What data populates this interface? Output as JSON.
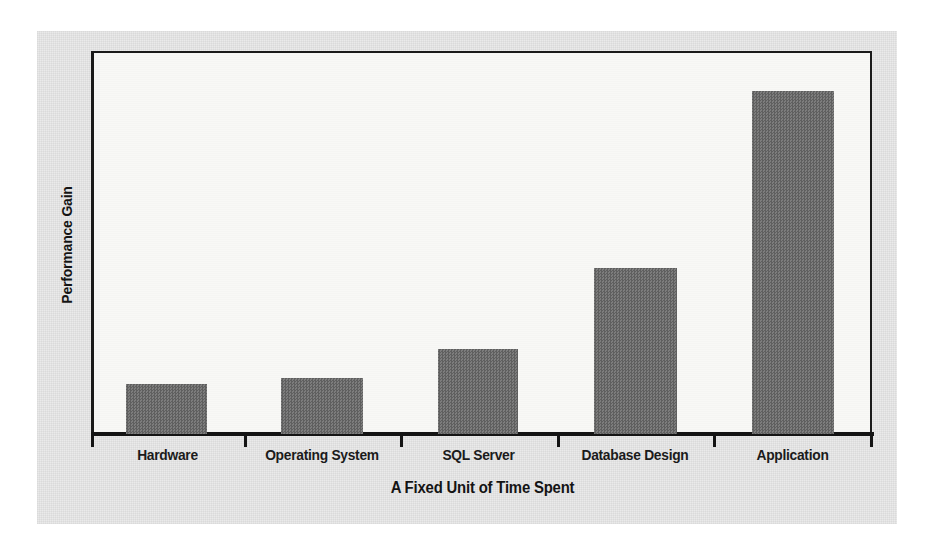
{
  "chart_data": {
    "type": "bar",
    "title": "",
    "xlabel": "A Fixed Unit of Time Spent",
    "ylabel": "Performance Gain",
    "categories": [
      "Hardware",
      "Operating System",
      "SQL Server",
      "Database Design",
      "Application"
    ],
    "values": [
      50,
      56,
      85,
      166,
      343
    ],
    "value_unit": "relative performance gain (unlabeled axis, pixel heights)",
    "ylim": [
      0,
      383
    ],
    "xlim": [
      0,
      5
    ],
    "grid": false,
    "legend": null,
    "axis_tick_labels_y": [],
    "annotations": [],
    "series": [
      {
        "name": "Performance Gain",
        "values": [
          50,
          56,
          85,
          166,
          343
        ],
        "color": "#6b6b6b"
      }
    ]
  },
  "figure": {
    "background_color": "#eaeaea",
    "plot_background_color": "#f8f8f6",
    "axis_color": "#141414",
    "bar_color": "#6b6b6b",
    "page_color": "#ffffff"
  },
  "axis": {
    "x_title": "A Fixed Unit of Time Spent",
    "y_title": "Performance Gain"
  },
  "bars": [
    {
      "label": "Hardware",
      "x": 126,
      "width": 81,
      "top": 384,
      "height": 50
    },
    {
      "label": "Operating System",
      "x": 281,
      "width": 82,
      "top": 378,
      "height": 56
    },
    {
      "label": "SQL Server",
      "x": 438,
      "width": 80,
      "top": 349,
      "height": 85
    },
    {
      "label": "Database Design",
      "x": 594,
      "width": 83,
      "top": 268,
      "height": 166
    },
    {
      "label": "Application",
      "x": 752,
      "width": 82,
      "top": 91,
      "height": 343
    }
  ],
  "ticks": [
    91,
    244,
    400,
    557,
    713,
    870
  ],
  "category_label_slots": [
    {
      "left": 91,
      "width": 153
    },
    {
      "left": 244,
      "width": 156
    },
    {
      "left": 400,
      "width": 157
    },
    {
      "left": 557,
      "width": 156
    },
    {
      "left": 713,
      "width": 159
    }
  ]
}
